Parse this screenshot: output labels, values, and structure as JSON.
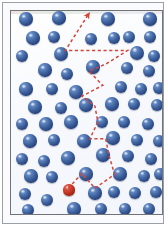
{
  "figure": {
    "width": 168,
    "height": 228
  },
  "colors": {
    "background": "#ffffff",
    "medium": "#fdfdff",
    "outer_frame_border": "#9aa0a6",
    "vessel_border": "#6f7479",
    "particle_blue": "#2b4883",
    "particle_blue_highlight": "#8badda",
    "particle_red": "#c3351f",
    "particle_red_highlight": "#e8786a",
    "path_red": "#d6453c"
  },
  "frame": {
    "outer": {
      "x": 2,
      "y": 2,
      "width": 162,
      "height": 222
    },
    "vessel": {
      "x": 7,
      "y": 7,
      "width": 153,
      "height": 205
    }
  },
  "particles": {
    "tracer_label": "tracer-particle",
    "medium_label": "medium-particle",
    "radius": 6.4,
    "tracer": {
      "cx": 65,
      "cy": 186,
      "r": 5.6,
      "color": "red"
    },
    "medium": [
      {
        "cx": 22,
        "cy": 15,
        "r": 6.6
      },
      {
        "cx": 55,
        "cy": 14,
        "r": 6.6
      },
      {
        "cx": 104,
        "cy": 15,
        "r": 6.6
      },
      {
        "cx": 146,
        "cy": 15,
        "r": 6.6
      },
      {
        "cx": 29,
        "cy": 34,
        "r": 6.6
      },
      {
        "cx": 50,
        "cy": 33,
        "r": 6.4
      },
      {
        "cx": 87,
        "cy": 35,
        "r": 6.4
      },
      {
        "cx": 110,
        "cy": 34,
        "r": 6.4
      },
      {
        "cx": 125,
        "cy": 33,
        "r": 6.2
      },
      {
        "cx": 146,
        "cy": 33,
        "r": 6.4
      },
      {
        "cx": 18,
        "cy": 52,
        "r": 6.4
      },
      {
        "cx": 57,
        "cy": 50,
        "r": 7.0
      },
      {
        "cx": 133,
        "cy": 49,
        "r": 7.0
      },
      {
        "cx": 150,
        "cy": 52,
        "r": 6.2
      },
      {
        "cx": 41,
        "cy": 66,
        "r": 6.6
      },
      {
        "cx": 63,
        "cy": 70,
        "r": 6.4
      },
      {
        "cx": 89,
        "cy": 63,
        "r": 6.6
      },
      {
        "cx": 123,
        "cy": 64,
        "r": 6.4
      },
      {
        "cx": 145,
        "cy": 67,
        "r": 6.4
      },
      {
        "cx": 22,
        "cy": 85,
        "r": 6.6
      },
      {
        "cx": 48,
        "cy": 85,
        "r": 6.4
      },
      {
        "cx": 72,
        "cy": 88,
        "r": 6.6
      },
      {
        "cx": 117,
        "cy": 83,
        "r": 6.4
      },
      {
        "cx": 137,
        "cy": 85,
        "r": 6.4
      },
      {
        "cx": 155,
        "cy": 84,
        "r": 6.2
      },
      {
        "cx": 31,
        "cy": 103,
        "r": 6.6
      },
      {
        "cx": 57,
        "cy": 104,
        "r": 6.4
      },
      {
        "cx": 82,
        "cy": 101,
        "r": 6.6
      },
      {
        "cx": 108,
        "cy": 100,
        "r": 6.6
      },
      {
        "cx": 130,
        "cy": 100,
        "r": 6.4
      },
      {
        "cx": 153,
        "cy": 101,
        "r": 6.2
      },
      {
        "cx": 18,
        "cy": 120,
        "r": 6.4
      },
      {
        "cx": 42,
        "cy": 120,
        "r": 6.6
      },
      {
        "cx": 67,
        "cy": 118,
        "r": 6.6
      },
      {
        "cx": 98,
        "cy": 118,
        "r": 6.4
      },
      {
        "cx": 120,
        "cy": 118,
        "r": 6.4
      },
      {
        "cx": 144,
        "cy": 120,
        "r": 6.4
      },
      {
        "cx": 26,
        "cy": 137,
        "r": 6.6
      },
      {
        "cx": 50,
        "cy": 136,
        "r": 6.4
      },
      {
        "cx": 80,
        "cy": 137,
        "r": 6.6
      },
      {
        "cx": 109,
        "cy": 134,
        "r": 6.6
      },
      {
        "cx": 133,
        "cy": 136,
        "r": 6.4
      },
      {
        "cx": 155,
        "cy": 137,
        "r": 6.0
      },
      {
        "cx": 18,
        "cy": 155,
        "r": 6.4
      },
      {
        "cx": 40,
        "cy": 157,
        "r": 6.4
      },
      {
        "cx": 64,
        "cy": 154,
        "r": 6.6
      },
      {
        "cx": 99,
        "cy": 151,
        "r": 6.6
      },
      {
        "cx": 124,
        "cy": 152,
        "r": 6.4
      },
      {
        "cx": 147,
        "cy": 155,
        "r": 6.2
      },
      {
        "cx": 27,
        "cy": 172,
        "r": 6.6
      },
      {
        "cx": 48,
        "cy": 173,
        "r": 6.4
      },
      {
        "cx": 82,
        "cy": 170,
        "r": 6.6
      },
      {
        "cx": 116,
        "cy": 170,
        "r": 6.6
      },
      {
        "cx": 140,
        "cy": 172,
        "r": 6.2
      },
      {
        "cx": 156,
        "cy": 170,
        "r": 6.0
      },
      {
        "cx": 21,
        "cy": 190,
        "r": 6.4
      },
      {
        "cx": 91,
        "cy": 189,
        "r": 6.6
      },
      {
        "cx": 110,
        "cy": 188,
        "r": 6.4
      },
      {
        "cx": 131,
        "cy": 189,
        "r": 6.4
      },
      {
        "cx": 152,
        "cy": 188,
        "r": 6.0
      },
      {
        "cx": 43,
        "cy": 196,
        "r": 6.4
      },
      {
        "cx": 70,
        "cy": 205,
        "r": 6.6
      },
      {
        "cx": 24,
        "cy": 206,
        "r": 6.4
      },
      {
        "cx": 97,
        "cy": 205,
        "r": 6.4
      },
      {
        "cx": 121,
        "cy": 205,
        "r": 6.4
      },
      {
        "cx": 145,
        "cy": 205,
        "r": 6.2
      }
    ]
  },
  "trajectory": {
    "label": "random-walk-path",
    "stroke": "#d6453c",
    "stroke_width": 1.5,
    "dash": "3.2 2.6",
    "arrowhead_at": {
      "x": 85,
      "y": 11
    },
    "start_at": {
      "x": 65,
      "y": 186
    },
    "points": [
      {
        "x": 65,
        "y": 186
      },
      {
        "x": 79,
        "y": 171
      },
      {
        "x": 92,
        "y": 186
      },
      {
        "x": 112,
        "y": 172
      },
      {
        "x": 106,
        "y": 152
      },
      {
        "x": 103,
        "y": 136
      },
      {
        "x": 87,
        "y": 136
      },
      {
        "x": 95,
        "y": 119
      },
      {
        "x": 92,
        "y": 103
      },
      {
        "x": 79,
        "y": 93
      },
      {
        "x": 100,
        "y": 82
      },
      {
        "x": 86,
        "y": 68
      },
      {
        "x": 104,
        "y": 60
      },
      {
        "x": 125,
        "y": 47
      },
      {
        "x": 62,
        "y": 47
      },
      {
        "x": 85,
        "y": 11
      }
    ]
  }
}
